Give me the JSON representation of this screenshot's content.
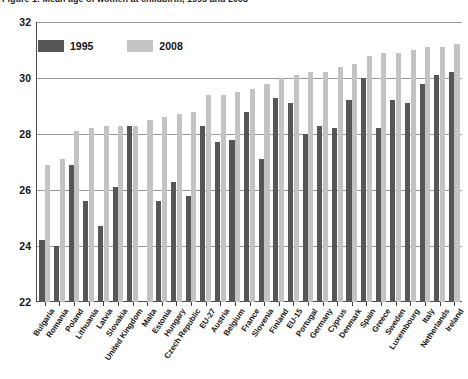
{
  "title": {
    "text": "Figure 1: Mean age of women at childbirth, 1995 and 2008"
  },
  "legend": {
    "position": "top-left",
    "items": [
      {
        "label": "1995",
        "color": "#565656"
      },
      {
        "label": "2008",
        "color": "#c3c3c3"
      }
    ]
  },
  "axis": {
    "y_ticks": [
      "32",
      "30",
      "28",
      "26",
      "24",
      "22"
    ],
    "y_min": 22,
    "y_max": 32,
    "y_step": 2
  },
  "chart_data": {
    "type": "bar",
    "title": "Figure 1: Mean age of women at childbirth, 1995 and 2008",
    "xlabel": "",
    "ylabel": "",
    "ylim": [
      22,
      32
    ],
    "grid": true,
    "legend_position": "top-left",
    "categories": [
      "Bulgaria",
      "Romania",
      "Poland",
      "Lithuania",
      "Latvia",
      "Slovakia",
      "United Kingdom",
      "Malta",
      "Estonia",
      "Hungary",
      "Czech Republic",
      "EU-27",
      "Austria",
      "Belgium",
      "France",
      "Slovenia",
      "Finland",
      "EU-15",
      "Portugal",
      "Germany",
      "Cyprus",
      "Denmark",
      "Spain",
      "Greece",
      "Sweden",
      "Luxembourg",
      "Italy",
      "Netherlands",
      "Ireland"
    ],
    "series": [
      {
        "name": "1995",
        "color": "#565656",
        "values": [
          24.2,
          24.0,
          26.9,
          25.6,
          24.7,
          26.1,
          28.3,
          null,
          25.6,
          26.3,
          25.8,
          28.3,
          27.7,
          27.8,
          28.8,
          27.1,
          29.3,
          29.1,
          28.0,
          28.3,
          28.2,
          29.2,
          30.0,
          28.2,
          29.2,
          29.1,
          29.8,
          30.1,
          30.2
        ]
      },
      {
        "name": "2008",
        "color": "#c3c3c3",
        "values": [
          26.9,
          27.1,
          28.1,
          28.2,
          28.3,
          28.3,
          28.3,
          28.5,
          28.6,
          28.7,
          28.8,
          29.4,
          29.4,
          29.5,
          29.6,
          29.8,
          30.0,
          30.1,
          30.2,
          30.2,
          30.4,
          30.5,
          30.8,
          30.9,
          30.9,
          31.0,
          31.1,
          31.1,
          31.2
        ]
      }
    ]
  }
}
